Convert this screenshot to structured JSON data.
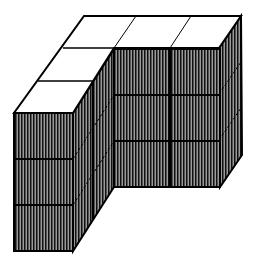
{
  "figure": {
    "colors": {
      "background": "#ffffff",
      "top_face": "#ffffff",
      "side_fill": "#7a7a7a",
      "hatch_line": "#111111",
      "edge": "#000000"
    },
    "grid": {
      "back_row_cubes": 3,
      "left_arm_extra_cubes": 2,
      "layers": 3
    }
  }
}
